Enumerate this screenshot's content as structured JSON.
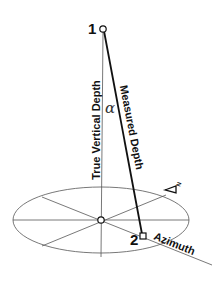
{
  "diagram": {
    "points": [
      {
        "id": "1",
        "label": "1",
        "x": 103,
        "y": 29,
        "shape": "circle"
      },
      {
        "id": "2",
        "label": "2",
        "x": 143,
        "y": 236,
        "shape": "square"
      },
      {
        "id": "center",
        "label": "",
        "x": 101,
        "y": 220,
        "shape": "circle"
      }
    ],
    "labels": {
      "tvd": "True Vertical Depth",
      "md": "Measured Depth",
      "azimuth": "Azimuth",
      "angle": "α",
      "point1": "1",
      "point2": "2",
      "north": "N"
    },
    "colors": {
      "thin_line": "#555555",
      "thick_line": "#111111",
      "text": "#111111",
      "background": "#ffffff"
    }
  }
}
